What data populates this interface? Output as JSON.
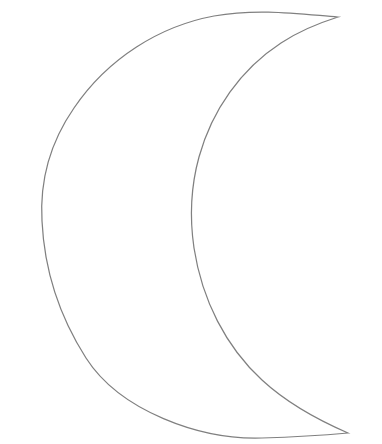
{
  "document": {
    "title": "Crescent Moon Outline",
    "kind": "line-art-drawing",
    "subject": "crescent-moon",
    "style": "coloring-page outline, unfilled"
  },
  "canvas": {
    "width": 382,
    "height": 444,
    "background_color": "#ffffff"
  },
  "drawing": {
    "name": "crescent-moon-outline",
    "stroke_color": "#808080",
    "stroke_width": 1.25,
    "fill_color": "none",
    "path": "M 338 17 C 300 14 258 8 214 16 C 160 26 108 58 74 108 C 47 147 40 186 42 221 C 44 263 56 311 86 358 C 120 411 200 440 262 438 C 296 437 326 435 348 433 C 318 420 288 404 262 380 C 226 347 202 300 194 248 C 189 214 191 186 199 157 C 212 110 241 69 281 43 C 299 31 319 23 338 17 Z",
    "subpaths": {
      "outer_arc": {
        "name": "outer-arc",
        "description": "large convex arc forming the outer edge of the crescent",
        "top_cusp": [
          338,
          17
        ],
        "top_extreme": [
          250,
          8
        ],
        "left_extreme": [
          42,
          221
        ],
        "bottom_extreme": [
          255,
          438
        ],
        "bottom_cusp": [
          348,
          433
        ]
      },
      "inner_arc": {
        "name": "inner-arc",
        "description": "concave arc forming the inner bite of the crescent",
        "top_cusp": [
          338,
          17
        ],
        "left_extreme": [
          192,
          221
        ],
        "bottom_cusp": [
          348,
          433
        ]
      }
    },
    "cusps": [
      {
        "name": "top-cusp",
        "x": 338,
        "y": 17
      },
      {
        "name": "bottom-cusp",
        "x": 348,
        "y": 433
      }
    ]
  }
}
